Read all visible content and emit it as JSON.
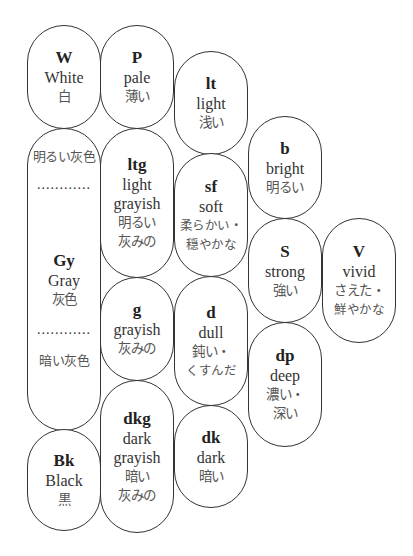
{
  "diagram": {
    "type": "tone-map",
    "border_color": "#333333",
    "tones": [
      {
        "id": "W",
        "abbr": "W",
        "en": "White",
        "ja": [
          "白"
        ]
      },
      {
        "id": "P",
        "abbr": "P",
        "en": "pale",
        "ja": [
          "薄い"
        ]
      },
      {
        "id": "lt",
        "abbr": "lt",
        "en": "light",
        "ja": [
          "浅い"
        ]
      },
      {
        "id": "b",
        "abbr": "b",
        "en": "bright",
        "ja": [
          "明るい"
        ]
      },
      {
        "id": "ltg",
        "abbr": "ltg",
        "en": "light grayish",
        "en_lines": [
          "light",
          "grayish"
        ],
        "ja": [
          "明るい",
          "灰みの"
        ]
      },
      {
        "id": "sf",
        "abbr": "sf",
        "en": "soft",
        "ja": [
          "柔らかい・",
          "穏やかな"
        ]
      },
      {
        "id": "S",
        "abbr": "S",
        "en": "strong",
        "ja": [
          "強い"
        ]
      },
      {
        "id": "V",
        "abbr": "V",
        "en": "vivid",
        "ja": [
          "さえた・",
          "鮮やかな"
        ]
      },
      {
        "id": "Gy",
        "abbr": "Gy",
        "en": "Gray",
        "ja": [
          "灰色"
        ],
        "upper_label": "明るい灰色",
        "lower_label": "暗い灰色",
        "divider": "............"
      },
      {
        "id": "g",
        "abbr": "g",
        "en": "grayish",
        "ja": [
          "灰みの"
        ]
      },
      {
        "id": "d",
        "abbr": "d",
        "en": "dull",
        "ja": [
          "鈍い・",
          "くすんだ"
        ]
      },
      {
        "id": "dp",
        "abbr": "dp",
        "en": "deep",
        "ja": [
          "濃い・",
          "深い"
        ]
      },
      {
        "id": "dkg",
        "abbr": "dkg",
        "en": "dark grayish",
        "en_lines": [
          "dark",
          "grayish"
        ],
        "ja": [
          "暗い",
          "灰みの"
        ]
      },
      {
        "id": "dk",
        "abbr": "dk",
        "en": "dark",
        "ja": [
          "暗い"
        ]
      },
      {
        "id": "Bk",
        "abbr": "Bk",
        "en": "Black",
        "ja": [
          "黒"
        ]
      }
    ]
  }
}
